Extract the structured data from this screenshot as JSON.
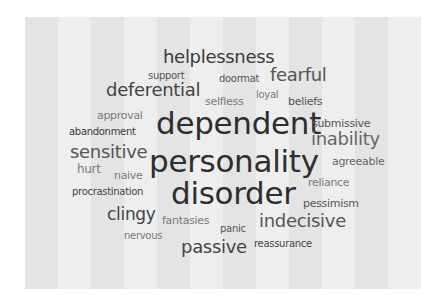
{
  "card": {
    "background_dark": "#e4e4e4",
    "background_light": "#eeeeee"
  },
  "words": [
    {
      "text": "helplessness",
      "x": 163,
      "y": 48,
      "size": 18,
      "color": "#3a3a3a"
    },
    {
      "text": "support",
      "x": 148,
      "y": 71,
      "size": 10,
      "color": "#555555"
    },
    {
      "text": "doormat",
      "x": 219,
      "y": 74,
      "size": 10,
      "color": "#555555"
    },
    {
      "text": "fearful",
      "x": 270,
      "y": 66,
      "size": 18,
      "color": "#555555"
    },
    {
      "text": "deferential",
      "x": 106,
      "y": 81,
      "size": 18,
      "color": "#444444"
    },
    {
      "text": "selfless",
      "x": 205,
      "y": 96,
      "size": 11,
      "color": "#7a7a7a"
    },
    {
      "text": "loyal",
      "x": 256,
      "y": 90,
      "size": 10,
      "color": "#7a7a7a"
    },
    {
      "text": "beliefs",
      "x": 288,
      "y": 96,
      "size": 11,
      "color": "#555555"
    },
    {
      "text": "approval",
      "x": 97,
      "y": 110,
      "size": 11,
      "color": "#7a7a7a"
    },
    {
      "text": "dependent",
      "x": 156,
      "y": 108,
      "size": 31,
      "color": "#2e2e2e"
    },
    {
      "text": "submissive",
      "x": 312,
      "y": 118,
      "size": 11,
      "color": "#555555"
    },
    {
      "text": "abandonment",
      "x": 69,
      "y": 127,
      "size": 10,
      "color": "#3a3a3a"
    },
    {
      "text": "inability",
      "x": 311,
      "y": 130,
      "size": 18,
      "color": "#666666"
    },
    {
      "text": "sensitive",
      "x": 70,
      "y": 143,
      "size": 18,
      "color": "#555555"
    },
    {
      "text": "personality",
      "x": 149,
      "y": 146,
      "size": 31,
      "color": "#2e2e2e"
    },
    {
      "text": "agreeable",
      "x": 332,
      "y": 156,
      "size": 11,
      "color": "#666666"
    },
    {
      "text": "hurt",
      "x": 77,
      "y": 163,
      "size": 12,
      "color": "#7a7a7a"
    },
    {
      "text": "naive",
      "x": 114,
      "y": 170,
      "size": 11,
      "color": "#7a7a7a"
    },
    {
      "text": "reliance",
      "x": 308,
      "y": 177,
      "size": 11,
      "color": "#7a7a7a"
    },
    {
      "text": "procrastination",
      "x": 72,
      "y": 187,
      "size": 10,
      "color": "#444444"
    },
    {
      "text": "disorder",
      "x": 171,
      "y": 178,
      "size": 31,
      "color": "#2e2e2e"
    },
    {
      "text": "pessimism",
      "x": 303,
      "y": 198,
      "size": 11,
      "color": "#555555"
    },
    {
      "text": "clingy",
      "x": 107,
      "y": 206,
      "size": 17,
      "color": "#444444"
    },
    {
      "text": "fantasies",
      "x": 162,
      "y": 215,
      "size": 11,
      "color": "#7a7a7a"
    },
    {
      "text": "panic",
      "x": 220,
      "y": 224,
      "size": 10,
      "color": "#555555"
    },
    {
      "text": "indecisive",
      "x": 259,
      "y": 212,
      "size": 18,
      "color": "#555555"
    },
    {
      "text": "nervous",
      "x": 124,
      "y": 231,
      "size": 10,
      "color": "#7a7a7a"
    },
    {
      "text": "passive",
      "x": 181,
      "y": 238,
      "size": 18,
      "color": "#444444"
    },
    {
      "text": "reassurance",
      "x": 254,
      "y": 239,
      "size": 10,
      "color": "#444444"
    }
  ]
}
